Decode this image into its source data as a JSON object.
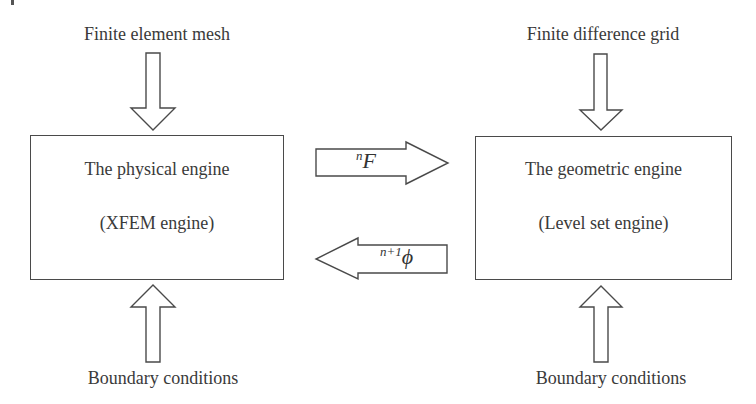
{
  "diagram": {
    "title": "",
    "nodes": {
      "physical_engine": {
        "line1": "The physical engine",
        "line2": "(XFEM engine)"
      },
      "geometric_engine": {
        "line1": "The geometric engine",
        "line2": "(Level set engine)"
      }
    },
    "inputs": {
      "top_left": "Finite element mesh",
      "top_right": "Finite difference grid",
      "bottom_left": "Boundary conditions",
      "bottom_right": "Boundary conditions"
    },
    "edges": {
      "physical_to_geometric": {
        "superscript": "n",
        "symbol": "F",
        "direction": "right"
      },
      "geometric_to_physical": {
        "superscript": "n+1",
        "symbol": "ϕ",
        "direction": "left"
      }
    },
    "colors": {
      "stroke": "#4a4a4a",
      "text": "#3a3a3a",
      "background": "#ffffff"
    }
  }
}
